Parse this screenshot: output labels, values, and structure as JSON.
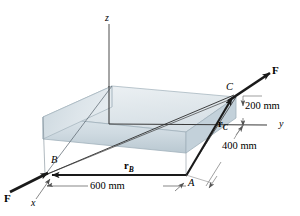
{
  "figure": {
    "points": {
      "A": "A",
      "B": "B",
      "C": "C"
    },
    "axes": {
      "x": "x",
      "y": "y",
      "z": "z"
    },
    "vectors": {
      "r_b_symbol": "r",
      "r_b_sub": "B",
      "r_c_symbol": "r",
      "r_c_sub": "C",
      "force_top": "F",
      "force_bottom": "F"
    },
    "dimensions": {
      "length": "600 mm",
      "depth": "400 mm",
      "height": "200 mm"
    },
    "colors": {
      "line": "#231f20",
      "thin_line": "#4d4d4d",
      "box_top": "#e3e9ed",
      "box_front": "#ccd8df",
      "box_left": "#dde5ea",
      "box_edge": "#9fb0ba",
      "background": "#ffffff"
    }
  }
}
